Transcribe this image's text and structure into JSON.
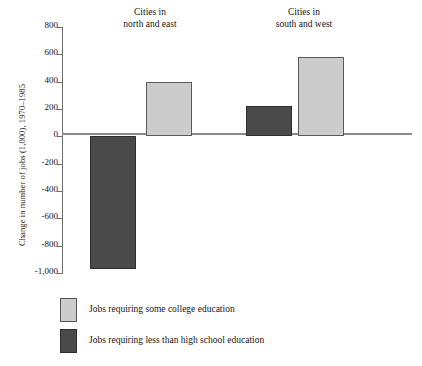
{
  "chart_data": {
    "type": "bar",
    "title": "",
    "xlabel": "",
    "ylabel": "Change in number of jobs (1,000), 1970–1985",
    "categories": [
      "Cities in\nnorth and east",
      "Cities in\nsouth and west"
    ],
    "series": [
      {
        "name": "Jobs  requiring some college education",
        "color": "#cccccc",
        "values": [
          400,
          580
        ]
      },
      {
        "name": "Jobs requiring less than high school education",
        "color": "#4a4a4a",
        "values": [
          -970,
          220
        ]
      }
    ],
    "ylim": [
      -1000,
      800
    ],
    "yticks": [
      800,
      600,
      400,
      200,
      0,
      -200,
      -400,
      -600,
      -800,
      -1000
    ],
    "ytick_labels": [
      "800",
      "600",
      "400",
      "200",
      "0",
      "-200",
      "-400",
      "-600",
      "-800",
      "-1,000"
    ],
    "grid": false,
    "legend_position": "bottom-left",
    "zero_line": true
  },
  "axis": {
    "y_label": "Change in number of jobs (1,000), 1970–1985",
    "ticks": [
      {
        "value": 800,
        "label": "800"
      },
      {
        "value": 600,
        "label": "600"
      },
      {
        "value": 400,
        "label": "400"
      },
      {
        "value": 200,
        "label": "200"
      },
      {
        "value": 0,
        "label": "0"
      },
      {
        "value": -200,
        "label": "-200"
      },
      {
        "value": -400,
        "label": "-400"
      },
      {
        "value": -600,
        "label": "-600"
      },
      {
        "value": -800,
        "label": "-800"
      },
      {
        "value": -1000,
        "label": "-1,000"
      }
    ]
  },
  "groups": [
    {
      "header": "Cities in\nnorth and east"
    },
    {
      "header": "Cities in\nsouth and west"
    }
  ],
  "legend": {
    "items": [
      {
        "label": "Jobs  requiring some college education",
        "swatch": "light"
      },
      {
        "label": "Jobs requiring less than high school education",
        "swatch": "dark"
      }
    ]
  }
}
